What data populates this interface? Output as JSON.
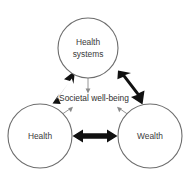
{
  "diagram": {
    "canvas": {
      "width": 190,
      "height": 180,
      "background": "#ffffff"
    },
    "colors": {
      "circle_stroke": "#6d6d6d",
      "circle_fill": "#ffffff",
      "thick_arrow": "#111111",
      "thin_arrow": "#8a8a8a",
      "label_text": "#3a3a3a"
    },
    "nodes": [
      {
        "id": "health-systems",
        "label_line1": "Health",
        "label_line2": "systems",
        "cx": 88,
        "cy": 48,
        "r": 30
      },
      {
        "id": "health",
        "label_line1": "Health",
        "label_line2": "",
        "cx": 40,
        "cy": 136,
        "r": 32
      },
      {
        "id": "wealth",
        "label_line1": "Wealth",
        "label_line2": "",
        "cx": 150,
        "cy": 136,
        "r": 32
      }
    ],
    "center_label": "Societal well-being",
    "thick_connectors": [
      {
        "id": "health-to-health-systems",
        "from": "health",
        "to": "health-systems",
        "style": "double-headed"
      },
      {
        "id": "health-systems-to-wealth",
        "from": "health-systems",
        "to": "wealth",
        "style": "double-headed"
      },
      {
        "id": "health-to-wealth",
        "from": "health",
        "to": "wealth",
        "style": "double-headed"
      }
    ],
    "thin_connectors": [
      {
        "id": "health-systems-to-center",
        "from": "health-systems",
        "to": "center_label",
        "style": "single-headed"
      },
      {
        "id": "health-to-center",
        "from": "health",
        "to": "center_label",
        "style": "single-headed"
      },
      {
        "id": "wealth-to-center",
        "from": "wealth",
        "to": "center_label",
        "style": "single-headed"
      }
    ]
  }
}
